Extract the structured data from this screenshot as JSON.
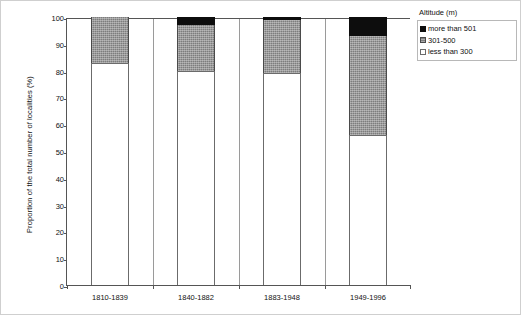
{
  "chart_data": {
    "type": "bar",
    "subtype": "stacked-bar-100",
    "title": "",
    "xlabel": "",
    "ylabel": "Proportion of the total number of localities (%)",
    "ylim": [
      0,
      100
    ],
    "yticks": [
      0,
      10,
      20,
      30,
      40,
      50,
      60,
      70,
      80,
      90,
      100
    ],
    "grid": false,
    "legend_position": "right",
    "legend_title": "Altitude (m)",
    "categories": [
      "1810-1839",
      "1840-1882",
      "1883-1948",
      "1949-1996"
    ],
    "series": [
      {
        "name": "less than 300",
        "values": [
          83,
          80,
          79,
          56
        ],
        "color": "#ffffff"
      },
      {
        "name": "301-500",
        "values": [
          17,
          17,
          20,
          37
        ],
        "color": "#7d7d7d"
      },
      {
        "name": "more than 501",
        "values": [
          0,
          3,
          1,
          7
        ],
        "color": "#0d0d0d"
      }
    ]
  },
  "legend": {
    "title": "Altitude (m)",
    "items": [
      {
        "label": "more than 501",
        "swatch": "black-swatch"
      },
      {
        "label": "301-500",
        "swatch": "gray-hatched-swatch"
      },
      {
        "label": "less than 300",
        "swatch": "white-swatch"
      }
    ]
  },
  "axes": {
    "y_title": "Proportion of the total number of localities (%)",
    "y_ticks": [
      "0",
      "10",
      "20",
      "30",
      "40",
      "50",
      "60",
      "70",
      "80",
      "90",
      "100"
    ],
    "x_ticks": [
      "1810-1839",
      "1840-1882",
      "1883-1948",
      "1949-1996"
    ]
  }
}
